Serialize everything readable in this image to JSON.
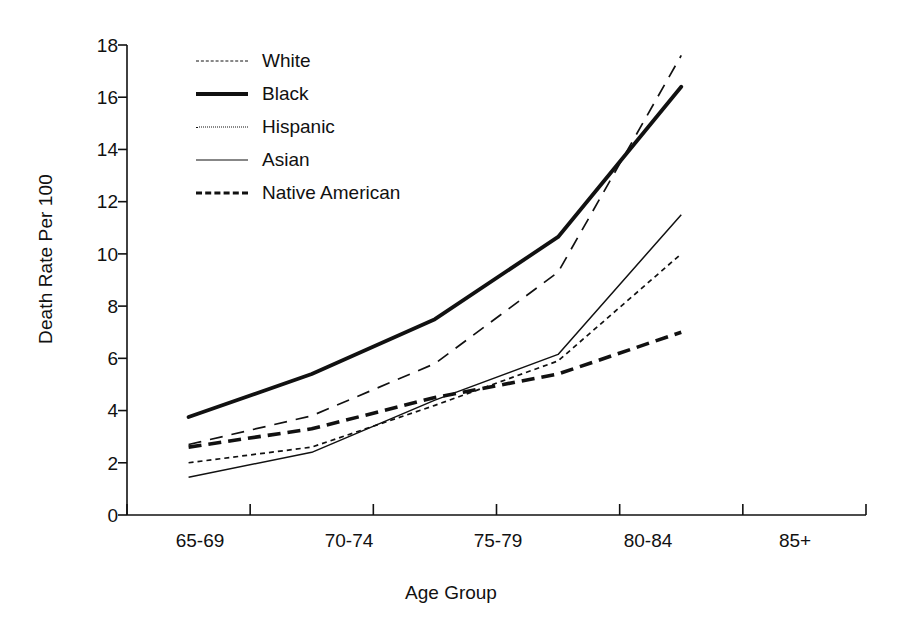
{
  "chart_data": {
    "type": "line",
    "title": "",
    "xlabel": "Age Group",
    "ylabel": "Death Rate Per 100",
    "categories": [
      "65-69",
      "70-74",
      "75-79",
      "80-84",
      "85+"
    ],
    "ylim": [
      0,
      18
    ],
    "yticks": [
      "0",
      "2",
      "4",
      "6",
      "8",
      "10",
      "12",
      "14",
      "16",
      "18"
    ],
    "grid": false,
    "legend_position": "upper-left-inside",
    "series": [
      {
        "name": "White",
        "style": "long-dashed-thin",
        "values": [
          2.7,
          3.8,
          5.8,
          9.3,
          17.6
        ]
      },
      {
        "name": "Black",
        "style": "thick-solid",
        "values": [
          3.75,
          5.4,
          7.5,
          10.65,
          16.4
        ]
      },
      {
        "name": "Hispanic",
        "style": "fine-dotted",
        "values": [
          2.0,
          2.6,
          4.2,
          5.9,
          10.0
        ]
      },
      {
        "name": "Asian",
        "style": "thin-solid",
        "values": [
          1.45,
          2.4,
          4.4,
          6.15,
          11.5
        ]
      },
      {
        "name": "Native American",
        "style": "thick-dashed",
        "values": [
          2.6,
          3.3,
          4.5,
          5.4,
          7.0
        ]
      }
    ]
  },
  "legend": {
    "items": [
      {
        "label": "White"
      },
      {
        "label": "Black"
      },
      {
        "label": "Hispanic"
      },
      {
        "label": "Asian"
      },
      {
        "label": "Native American"
      }
    ]
  },
  "axes": {
    "y_label": "Death Rate Per 100",
    "x_label": "Age Group",
    "y_ticks": [
      "18",
      "16",
      "14",
      "12",
      "10",
      "8",
      "6",
      "4",
      "2",
      "0"
    ],
    "x_ticks": [
      "65-69",
      "70-74",
      "75-79",
      "80-84",
      "85+"
    ]
  },
  "colors": {
    "line": "#111111",
    "background": "#ffffff",
    "text": "#111111"
  }
}
